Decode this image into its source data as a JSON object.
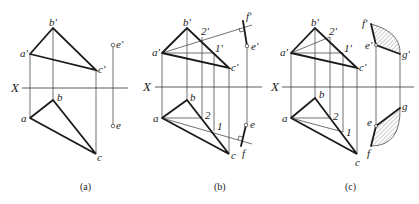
{
  "figure": {
    "type": "descriptive geometry orthographic projection",
    "panels": [
      {
        "id": "a",
        "caption": "(a)",
        "axis_label": "X",
        "labels": {
          "b_prime": "b'",
          "a_prime": "a'",
          "c_prime": "c'",
          "e_prime": "e'",
          "b": "b",
          "a": "a",
          "c": "c",
          "e": "e"
        }
      },
      {
        "id": "b",
        "caption": "(b)",
        "axis_label": "X",
        "labels": {
          "b_prime": "b'",
          "a_prime": "a'",
          "c_prime": "c'",
          "e_prime": "e'",
          "f_prime": "f'",
          "two_prime": "2'",
          "one_prime": "1'",
          "b": "b",
          "a": "a",
          "c": "c",
          "e": "e",
          "f": "f",
          "two": "2",
          "one": "1"
        }
      },
      {
        "id": "c",
        "caption": "(c)",
        "axis_label": "X",
        "labels": {
          "b_prime": "b'",
          "a_prime": "a'",
          "c_prime": "c'",
          "e_prime": "e'",
          "f_prime": "f'",
          "g_prime": "g'",
          "two_prime": "2'",
          "one_prime": "1'",
          "b": "b",
          "a": "a",
          "c": "c",
          "e": "e",
          "f": "f",
          "g": "g",
          "two": "2",
          "one": "1"
        }
      }
    ]
  }
}
